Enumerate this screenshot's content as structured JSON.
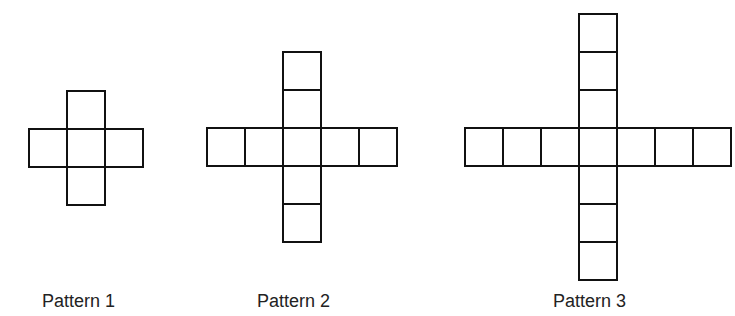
{
  "figure": {
    "type": "growing-plus-sign-pattern",
    "cell_size": 38,
    "stroke_color": "#111111",
    "patterns": [
      {
        "name": "pattern-1",
        "label": "Pattern 1",
        "arm_length": 1,
        "total_squares": 5,
        "center": {
          "x": 67,
          "y": 129
        },
        "label_pos": {
          "x": 42,
          "y": 292
        }
      },
      {
        "name": "pattern-2",
        "label": "Pattern 2",
        "arm_length": 2,
        "total_squares": 9,
        "center": {
          "x": 283,
          "y": 128
        },
        "label_pos": {
          "x": 257,
          "y": 292
        }
      },
      {
        "name": "pattern-3",
        "label": "Pattern 3",
        "arm_length": 3,
        "total_squares": 13,
        "center": {
          "x": 579,
          "y": 128
        },
        "label_pos": {
          "x": 553,
          "y": 292
        }
      }
    ]
  }
}
